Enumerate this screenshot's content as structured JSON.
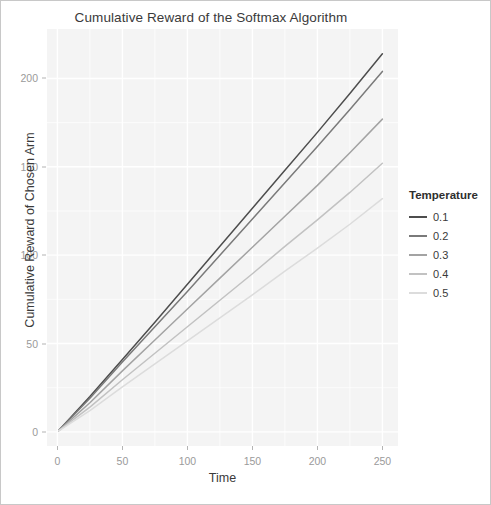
{
  "chart_data": {
    "type": "line",
    "title": "Cumulative Reward of the Softmax Algorithm",
    "xlabel": "Time",
    "ylabel": "Cumulative Reward of Chosen Arm",
    "xlim": [
      -8,
      262
    ],
    "ylim": [
      -8,
      228
    ],
    "xticks": [
      0,
      50,
      100,
      150,
      200,
      250
    ],
    "yticks": [
      0,
      50,
      100,
      150,
      200
    ],
    "grid": true,
    "legend_position": "right",
    "legend_title": "Temperature",
    "x": [
      1,
      25,
      50,
      75,
      100,
      125,
      150,
      175,
      200,
      225,
      250
    ],
    "series": [
      {
        "name": "0.1",
        "color": "#4d4d4d",
        "values": [
          0.8,
          20.0,
          41.0,
          62.0,
          83.5,
          105.0,
          126.5,
          148.0,
          169.5,
          191.5,
          214.0
        ]
      },
      {
        "name": "0.2",
        "color": "#7a7a7a",
        "values": [
          0.8,
          19.0,
          39.5,
          59.5,
          79.5,
          100.0,
          120.5,
          141.0,
          161.5,
          182.5,
          204.0
        ]
      },
      {
        "name": "0.3",
        "color": "#a3a3a3",
        "values": [
          0.7,
          16.5,
          34.5,
          52.0,
          69.5,
          87.0,
          104.5,
          122.0,
          139.5,
          158.0,
          177.0
        ]
      },
      {
        "name": "0.4",
        "color": "#c2c2c2",
        "values": [
          0.7,
          14.0,
          29.5,
          44.5,
          59.5,
          74.5,
          89.5,
          105.0,
          120.0,
          135.5,
          152.0
        ]
      },
      {
        "name": "0.5",
        "color": "#dcdcdc",
        "values": [
          0.6,
          12.0,
          25.5,
          38.5,
          51.5,
          64.5,
          77.5,
          91.0,
          104.0,
          117.5,
          132.0
        ]
      }
    ]
  }
}
